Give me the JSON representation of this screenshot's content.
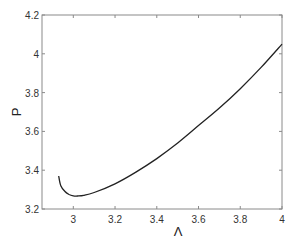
{
  "chart_data": {
    "type": "line",
    "title": "",
    "xlabel": "Λ",
    "ylabel": "P",
    "xlim": [
      2.85,
      4.0
    ],
    "ylim": [
      3.2,
      4.2
    ],
    "xticks": [
      "3",
      "3.2",
      "3.4",
      "3.6",
      "3.8",
      "4"
    ],
    "yticks": [
      "3.2",
      "3.4",
      "3.6",
      "3.8",
      "4",
      "4.2"
    ],
    "grid": false,
    "legend": null,
    "series": [
      {
        "name": "P(Λ)",
        "color": "#222222",
        "x": [
          2.93,
          2.94,
          2.96,
          2.98,
          3.0,
          3.02,
          3.05,
          3.1,
          3.2,
          3.3,
          3.4,
          3.5,
          3.6,
          3.7,
          3.8,
          3.9,
          4.0
        ],
        "y": [
          3.37,
          3.32,
          3.29,
          3.275,
          3.268,
          3.267,
          3.27,
          3.285,
          3.33,
          3.39,
          3.46,
          3.54,
          3.63,
          3.72,
          3.82,
          3.93,
          4.05
        ]
      }
    ]
  }
}
